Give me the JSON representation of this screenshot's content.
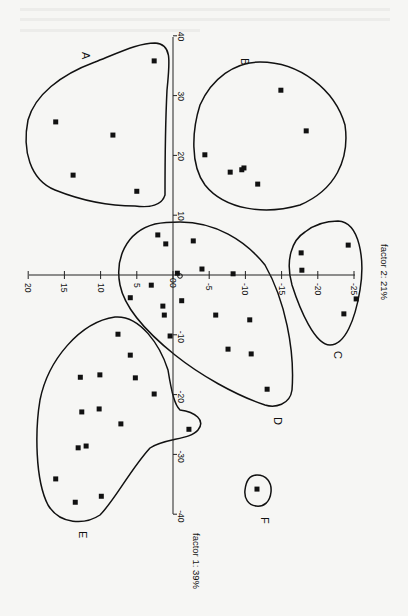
{
  "chart_data": {
    "type": "scatter",
    "title": "",
    "orientation": "rotated 90deg clockwise (factor 1 on vertical axis, factor 2 on horizontal axis)",
    "xlabel": "factor 2: 21%",
    "ylabel": "factor 1: 39%",
    "x_axis": {
      "name": "factor 2",
      "variance_label": "factor 2: 21%",
      "ticks": [
        20,
        15,
        10,
        5,
        0,
        -5,
        -10,
        -15,
        -20,
        -25
      ],
      "tick_labels": [
        "20",
        "15",
        "10",
        "5",
        "0",
        "-5",
        "-10",
        "-15",
        "-20",
        "-25"
      ],
      "range": [
        20,
        -25
      ]
    },
    "y_axis": {
      "name": "factor 1",
      "variance_label": "factor 1: 39%",
      "ticks": [
        40,
        30,
        20,
        10,
        0,
        -10,
        -20,
        -30,
        -40
      ],
      "tick_labels": [
        "40",
        "30",
        "20",
        "10",
        "0",
        "-10",
        "-20",
        "-30",
        "-40"
      ],
      "range": [
        40,
        -40
      ]
    },
    "grid": false,
    "legend": null,
    "origin_marker": {
      "factor2": -1,
      "factor1": 0
    },
    "clusters": [
      {
        "name": "A",
        "points": [
          {
            "factor2": 2.6,
            "factor1": 35.8
          },
          {
            "factor2": 16.2,
            "factor1": 25.6
          },
          {
            "factor2": 8.3,
            "factor1": 23.4
          },
          {
            "factor2": 13.8,
            "factor1": 16.7
          },
          {
            "factor2": 5.0,
            "factor1": 14.0
          }
        ]
      },
      {
        "name": "B",
        "points": [
          {
            "factor2": -14.9,
            "factor1": 30.9
          },
          {
            "factor2": -18.4,
            "factor1": 24.1
          },
          {
            "factor2": -4.4,
            "factor1": 20.1
          },
          {
            "factor2": -7.9,
            "factor1": 17.2
          },
          {
            "factor2": -9.5,
            "factor1": 17.6
          },
          {
            "factor2": -9.8,
            "factor1": 17.9
          },
          {
            "factor2": -11.7,
            "factor1": 15.2
          }
        ]
      },
      {
        "name": "C",
        "points": [
          {
            "factor2": -24.2,
            "factor1": 5.0
          },
          {
            "factor2": -17.7,
            "factor1": 3.7
          },
          {
            "factor2": -17.8,
            "factor1": 0.8
          },
          {
            "factor2": -25.3,
            "factor1": -4.0
          },
          {
            "factor2": -23.6,
            "factor1": -6.5
          }
        ]
      },
      {
        "name": "D",
        "points": [
          {
            "factor2": 2.1,
            "factor1": 6.7
          },
          {
            "factor2": 1.0,
            "factor1": 5.2
          },
          {
            "factor2": -2.8,
            "factor1": 5.7
          },
          {
            "factor2": -4.0,
            "factor1": 1.0
          },
          {
            "factor2": -0.6,
            "factor1": 0.3
          },
          {
            "factor2": -8.3,
            "factor1": 0.2
          },
          {
            "factor2": 3.0,
            "factor1": -1.7
          },
          {
            "factor2": 5.9,
            "factor1": -3.8
          },
          {
            "factor2": -1.2,
            "factor1": -4.3
          },
          {
            "factor2": 1.4,
            "factor1": -5.2
          },
          {
            "factor2": 1.2,
            "factor1": -6.7
          },
          {
            "factor2": -5.9,
            "factor1": -6.7
          },
          {
            "factor2": -10.6,
            "factor1": -7.5
          },
          {
            "factor2": 0.4,
            "factor1": -10.2
          },
          {
            "factor2": -7.6,
            "factor1": -12.4
          },
          {
            "factor2": -10.8,
            "factor1": -13.2
          },
          {
            "factor2": -13.0,
            "factor1": -19.1
          }
        ]
      },
      {
        "name": "E",
        "points": [
          {
            "factor2": 7.6,
            "factor1": -9.9
          },
          {
            "factor2": 5.9,
            "factor1": -13.4
          },
          {
            "factor2": 12.8,
            "factor1": -17.1
          },
          {
            "factor2": 10.1,
            "factor1": -16.7
          },
          {
            "factor2": 5.2,
            "factor1": -17.2
          },
          {
            "factor2": 2.6,
            "factor1": -19.9
          },
          {
            "factor2": 12.6,
            "factor1": -22.9
          },
          {
            "factor2": 10.2,
            "factor1": -22.4
          },
          {
            "factor2": 7.2,
            "factor1": -24.9
          },
          {
            "factor2": -2.2,
            "factor1": -25.8
          },
          {
            "factor2": 13.1,
            "factor1": -28.9
          },
          {
            "factor2": 12.0,
            "factor1": -28.6
          },
          {
            "factor2": 16.2,
            "factor1": -34.1
          },
          {
            "factor2": 9.9,
            "factor1": -37.0
          },
          {
            "factor2": 13.5,
            "factor1": -38.0
          }
        ]
      },
      {
        "name": "F",
        "points": [
          {
            "factor2": -11.6,
            "factor1": -35.8
          }
        ]
      }
    ],
    "annotations": [
      "A",
      "B",
      "C",
      "D",
      "E",
      "F"
    ]
  },
  "labels": {
    "cluster_A": "A",
    "cluster_B": "B",
    "cluster_C": "C",
    "cluster_D": "D",
    "cluster_E": "E",
    "cluster_F": "F",
    "factor1_title": "factor 1: 39%",
    "factor2_title": "factor 2: 21%",
    "x_ticks": [
      "20",
      "15",
      "10",
      "5",
      "0",
      "-5",
      "-10",
      "-15",
      "-20",
      "-25"
    ],
    "y_ticks": [
      "40",
      "30",
      "20",
      "10",
      "0",
      "-10",
      "-20",
      "-30",
      "-40"
    ]
  }
}
